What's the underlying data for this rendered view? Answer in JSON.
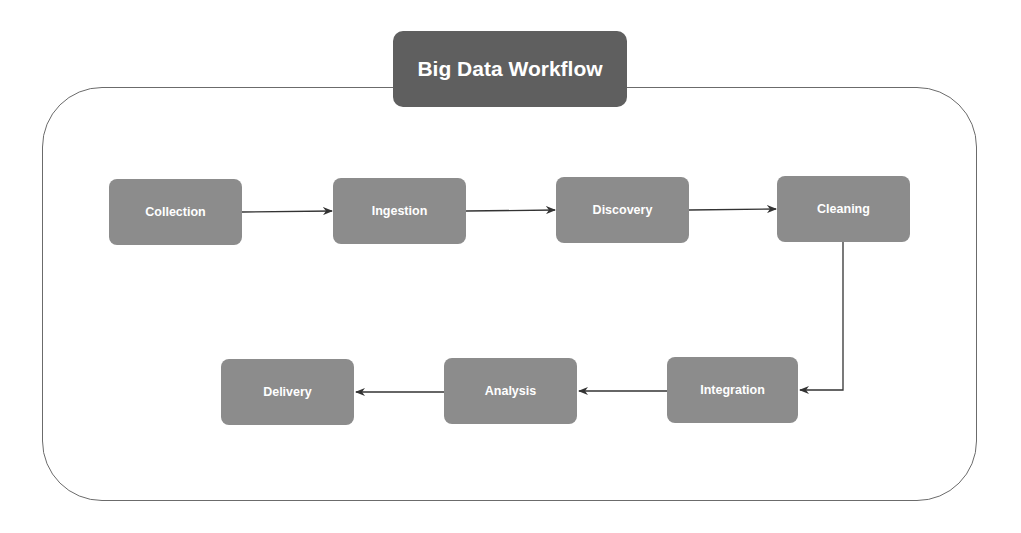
{
  "title": "Big Data Workflow",
  "colors": {
    "title_bg": "#5f5f5f",
    "node_bg": "#8c8c8c",
    "node_text": "#ffffff",
    "edge": "#333333",
    "container_border": "#6b6b6b"
  },
  "nodes": [
    {
      "id": "collection",
      "label": "Collection"
    },
    {
      "id": "ingestion",
      "label": "Ingestion"
    },
    {
      "id": "discovery",
      "label": "Discovery"
    },
    {
      "id": "cleaning",
      "label": "Cleaning"
    },
    {
      "id": "integration",
      "label": "Integration"
    },
    {
      "id": "analysis",
      "label": "Analysis"
    },
    {
      "id": "delivery",
      "label": "Delivery"
    }
  ],
  "edges": [
    {
      "from": "Collection",
      "to": "Ingestion"
    },
    {
      "from": "Ingestion",
      "to": "Discovery"
    },
    {
      "from": "Discovery",
      "to": "Cleaning"
    },
    {
      "from": "Cleaning",
      "to": "Integration"
    },
    {
      "from": "Integration",
      "to": "Analysis"
    },
    {
      "from": "Analysis",
      "to": "Delivery"
    }
  ]
}
